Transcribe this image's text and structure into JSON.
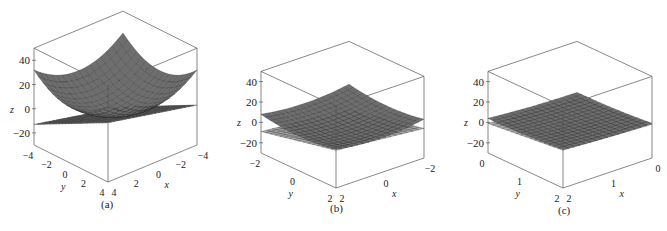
{
  "figure": {
    "surface_color": "#6e6e6e",
    "plane_color": "#a9a9a9",
    "highlight_color": "#e6e6e6",
    "grid_line_color": "#222222",
    "box_line_color": "#555555"
  },
  "chart_data": [
    {
      "type": "surface3d",
      "panel": "(a)",
      "caption": "(a)",
      "xlabel": "x",
      "ylabel": "y",
      "zlabel": "z",
      "xlim": [
        -4,
        4
      ],
      "ylim": [
        -4,
        4
      ],
      "zlim": [
        -30,
        50
      ],
      "x_ticks": [
        "-4",
        "-2",
        "0",
        "2",
        "4"
      ],
      "y_ticks": [
        "-4",
        "-2",
        "0",
        "2",
        "4"
      ],
      "z_ticks": [
        "40",
        "20",
        "0",
        "-20"
      ],
      "surfaces": [
        {
          "name": "paraboloid",
          "formula": "z = x^2 + y^2 (approx)",
          "range": [
            -4,
            4
          ],
          "grid": 16
        },
        {
          "name": "tangent plane",
          "formula": "z = 2x + 4y - 5 (approx)",
          "range": [
            -4,
            4
          ],
          "grid": 24
        }
      ]
    },
    {
      "type": "surface3d",
      "panel": "(b)",
      "caption": "(b)",
      "xlabel": "x",
      "ylabel": "y",
      "zlabel": "z",
      "xlim": [
        -2,
        2
      ],
      "ylim": [
        -2,
        2
      ],
      "zlim": [
        -30,
        50
      ],
      "x_ticks": [
        "-2",
        "0",
        "2"
      ],
      "y_ticks": [
        "-2",
        "0",
        "2"
      ],
      "z_ticks": [
        "40",
        "20",
        "0",
        "-20"
      ],
      "surfaces": [
        {
          "name": "paraboloid",
          "range": [
            -2,
            2
          ],
          "grid": 16
        },
        {
          "name": "tangent plane",
          "range": [
            -2,
            2
          ],
          "grid": 16
        }
      ]
    },
    {
      "type": "surface3d",
      "panel": "(c)",
      "caption": "(c)",
      "xlabel": "x",
      "ylabel": "y",
      "zlabel": "z",
      "xlim": [
        0,
        2
      ],
      "ylim": [
        0,
        2
      ],
      "zlim": [
        -30,
        50
      ],
      "x_ticks": [
        "0",
        "1",
        "2"
      ],
      "y_ticks": [
        "0",
        "1",
        "2"
      ],
      "z_ticks": [
        "40",
        "20",
        "0",
        "-20"
      ],
      "surfaces": [
        {
          "name": "paraboloid",
          "range": [
            0,
            2
          ],
          "grid": 16
        },
        {
          "name": "tangent plane",
          "range": [
            0,
            2
          ],
          "grid": 16
        }
      ]
    }
  ],
  "layout": {
    "panels": [
      {
        "front": [
          108,
          182
        ],
        "left": [
          34,
          145
        ],
        "right": [
          197,
          145
        ],
        "zscale": 1.21,
        "z0_at_front": -30
      },
      {
        "front": [
          336,
          188
        ],
        "left": [
          261,
          153
        ],
        "right": [
          424,
          158
        ],
        "zscale": 1.02,
        "z0_at_front": -30
      },
      {
        "front": [
          563,
          188
        ],
        "left": [
          488,
          153
        ],
        "right": [
          652,
          158
        ],
        "zscale": 1.02,
        "z0_at_front": -30
      }
    ],
    "captions": [
      {
        "text": "(a)",
        "x": 101,
        "y": 206
      },
      {
        "text": "(b)",
        "x": 330,
        "y": 210
      },
      {
        "text": "(c)",
        "x": 558,
        "y": 212
      }
    ]
  }
}
